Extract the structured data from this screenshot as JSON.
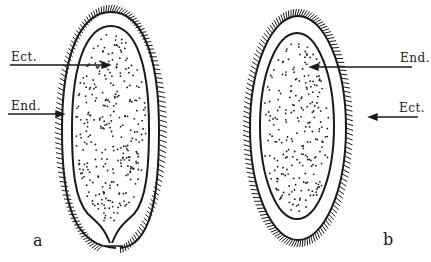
{
  "diagram": {
    "type": "biological cross-section (ciliated larva / planula)",
    "stroke_color": "#1a1a1a",
    "background": "#ffffff",
    "figures": [
      {
        "id": "a",
        "label": "a",
        "annotations": [
          {
            "text": "Ect.",
            "points_to": "ectoderm (outer layer)"
          },
          {
            "text": "End.",
            "points_to": "endoderm (inner mass)"
          }
        ],
        "feature": "pore / blastopore opening at lower pole"
      },
      {
        "id": "b",
        "label": "b",
        "annotations": [
          {
            "text": "End.",
            "points_to": "endoderm (inner mass)"
          },
          {
            "text": "Ect.",
            "points_to": "ectoderm (outer layer)"
          }
        ],
        "feature": "closed oval, no opening"
      }
    ]
  },
  "labels": {
    "a_ect": "Ect.",
    "a_end": "End.",
    "b_end": "End.",
    "b_ect": "Ect.",
    "fig_a": "a",
    "fig_b": "b"
  }
}
